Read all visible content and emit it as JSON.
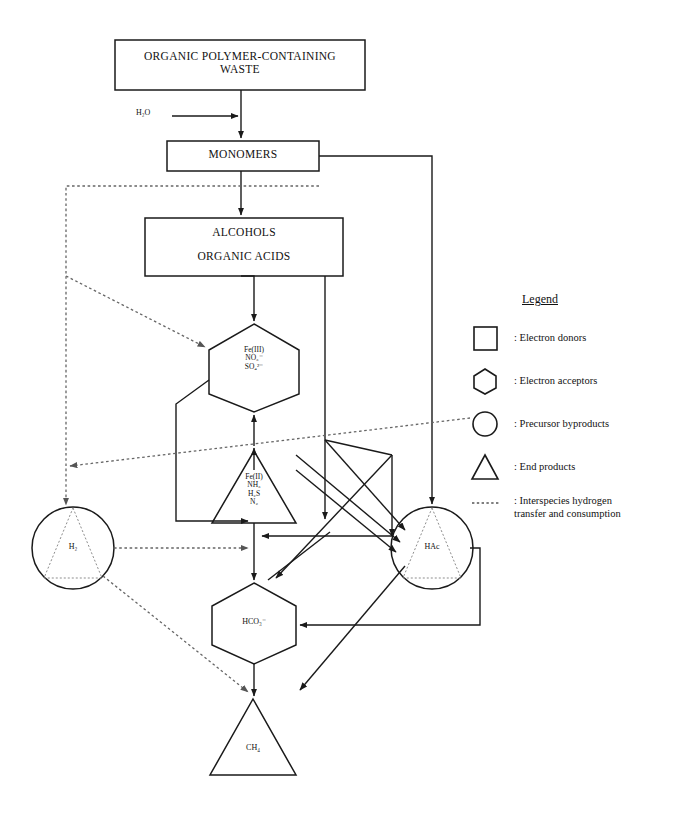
{
  "diagram": {
    "nodes": {
      "waste": {
        "label": "ORGANIC POLYMER-CONTAINING\nWASTE",
        "shape": "rectangle",
        "category": "electron-donors"
      },
      "water": {
        "label": "H₂O",
        "shape": "text",
        "category": "reactant"
      },
      "monomers": {
        "label": "MONOMERS",
        "shape": "rectangle",
        "category": "electron-donors"
      },
      "alcohols": {
        "label": "ALCOHOLS\n\nORGANIC ACIDS",
        "shape": "rectangle",
        "category": "electron-donors"
      },
      "acceptors1": {
        "label": "Fe(III)\nNO₃⁻\nSO₄²⁻",
        "shape": "hexagon",
        "category": "electron-acceptors"
      },
      "endprod1": {
        "label": "Fe(II)\nNH₃\nH₂S\nN₂",
        "shape": "triangle",
        "category": "end-products"
      },
      "h2": {
        "label": "H₂",
        "shape": "circle",
        "category": "precursor-byproducts"
      },
      "hac": {
        "label": "HAc",
        "shape": "circle",
        "category": "precursor-byproducts"
      },
      "hco3": {
        "label": "HCO₃⁻",
        "shape": "hexagon",
        "category": "electron-acceptors"
      },
      "ch4": {
        "label": "CH₄",
        "shape": "triangle",
        "category": "end-products"
      }
    },
    "legend": {
      "title": "Legend",
      "items": [
        {
          "symbol": "square",
          "text": ": Electron donors"
        },
        {
          "symbol": "hexagon",
          "text": ": Electron acceptors"
        },
        {
          "symbol": "circle",
          "text": ": Precursor byproducts"
        },
        {
          "symbol": "triangle",
          "text": ": End products"
        },
        {
          "symbol": "dotted-line",
          "text": ": Interspecies hydrogen\n  transfer and consumption"
        }
      ]
    },
    "colors": {
      "stroke": "#1a1a1a",
      "background": "#ffffff",
      "dotted": "#6e6e6e"
    }
  }
}
